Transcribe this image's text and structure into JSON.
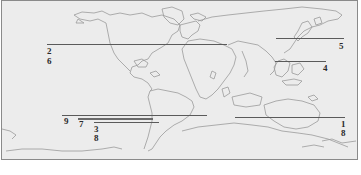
{
  "map": {
    "type": "world-outline",
    "background_color": "#ececec",
    "coastline_color": "#9a9a9a",
    "line_color": "#5a5a5a",
    "label_color": "#2a2a2a"
  },
  "markers": [
    {
      "id": "line-2-6",
      "labels": [
        "2",
        "6"
      ],
      "region": "north-america"
    },
    {
      "id": "line-5",
      "labels": [
        "5"
      ],
      "region": "east-asia-japan"
    },
    {
      "id": "line-4",
      "labels": [
        "4"
      ],
      "region": "southeast-asia"
    },
    {
      "id": "line-9",
      "labels": [
        "9"
      ],
      "region": "south-america-africa"
    },
    {
      "id": "line-7",
      "labels": [
        "7"
      ],
      "region": "south-america"
    },
    {
      "id": "line-3-8",
      "labels": [
        "3",
        "8"
      ],
      "region": "south-america"
    },
    {
      "id": "line-1-8",
      "labels": [
        "1",
        "8"
      ],
      "region": "australia"
    }
  ],
  "labels": {
    "l2": "2",
    "l6": "6",
    "l5": "5",
    "l4": "4",
    "l9": "9",
    "l7": "7",
    "l3": "3",
    "l8a": "8",
    "l1": "1",
    "l8b": "8"
  }
}
